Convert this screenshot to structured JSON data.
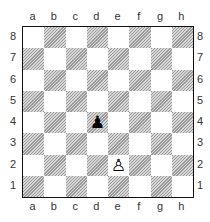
{
  "files": [
    "a",
    "b",
    "c",
    "d",
    "e",
    "f",
    "g",
    "h"
  ],
  "ranks": [
    "8",
    "7",
    "6",
    "5",
    "4",
    "3",
    "2",
    "1"
  ],
  "pieces": [
    {
      "square": "d4",
      "color": "black",
      "type": "pawn",
      "glyph": "♟"
    },
    {
      "square": "e2",
      "color": "white",
      "type": "pawn",
      "glyph": "♙"
    }
  ],
  "colors": {
    "dark_square": "#b8b8b8",
    "light_square": "#ffffff",
    "border": "#111111"
  }
}
